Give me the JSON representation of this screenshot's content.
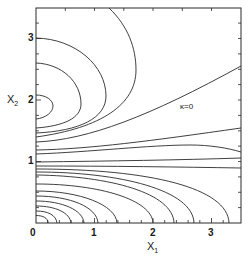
{
  "figure": {
    "x_axis": {
      "label": "X",
      "subscript": "1",
      "ticks": [
        "0",
        "1",
        "2",
        "3"
      ]
    },
    "y_axis": {
      "label": "X",
      "subscript": "2",
      "ticks": [
        "1",
        "2",
        "3"
      ]
    },
    "annotation": "κ=0",
    "line_color": "#2a2a2a"
  }
}
